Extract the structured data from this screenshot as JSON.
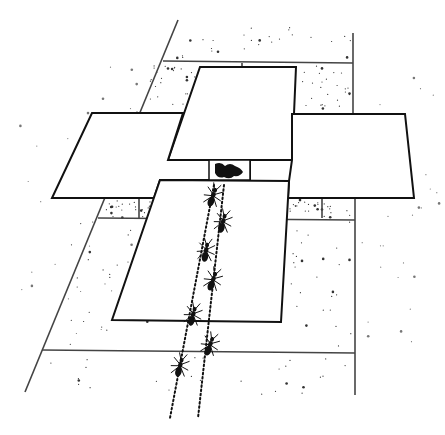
{
  "illustration": {
    "title": "Ants following trails across cards to food",
    "background": "#ffffff",
    "ink": "#111111",
    "paving": {
      "lines": [
        {
          "x1": 178,
          "y1": 20,
          "x2": 25,
          "y2": 392
        },
        {
          "x1": 163,
          "y1": 61,
          "x2": 353,
          "y2": 63
        },
        {
          "x1": 353,
          "y1": 33,
          "x2": 353,
          "y2": 115
        },
        {
          "x1": 98,
          "y1": 218,
          "x2": 355,
          "y2": 220
        },
        {
          "x1": 355,
          "y1": 198,
          "x2": 355,
          "y2": 395
        },
        {
          "x1": 42,
          "y1": 350,
          "x2": 355,
          "y2": 353
        },
        {
          "x1": 322,
          "y1": 198,
          "x2": 322,
          "y2": 218
        },
        {
          "x1": 139,
          "y1": 198,
          "x2": 139,
          "y2": 218
        },
        {
          "x1": 242,
          "y1": 63,
          "x2": 242,
          "y2": 67
        }
      ]
    },
    "cards": [
      {
        "name": "top-card",
        "points": "200,67 296,67 292,160 168,160"
      },
      {
        "name": "left-card",
        "points": "92,113 183,113 168,160 250,160 250,180 160,180 154,198 52,198"
      },
      {
        "name": "right-card",
        "points": "293,114 405,114 414,198 288,198 289,181 292,160 292,114"
      },
      {
        "name": "bottom-card",
        "points": "160,180 289,181 281,322 112,320"
      }
    ],
    "food": {
      "x": 209,
      "y": 160,
      "width": 41,
      "height": 20
    },
    "trails": [
      {
        "x1": 214,
        "y1": 185,
        "x2": 170,
        "y2": 418
      },
      {
        "x1": 224,
        "y1": 185,
        "x2": 198,
        "y2": 418
      }
    ],
    "ants": [
      {
        "x": 213,
        "y": 196,
        "angle": 20
      },
      {
        "x": 223,
        "y": 222,
        "angle": 15
      },
      {
        "x": 206,
        "y": 251,
        "angle": 10
      },
      {
        "x": 213,
        "y": 280,
        "angle": 20
      },
      {
        "x": 193,
        "y": 315,
        "angle": 15
      },
      {
        "x": 210,
        "y": 345,
        "angle": 20
      },
      {
        "x": 180,
        "y": 366,
        "angle": 15
      }
    ]
  }
}
